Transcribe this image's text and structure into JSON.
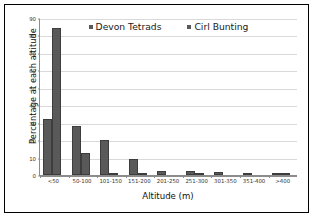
{
  "chart_data": {
    "type": "bar",
    "title": "",
    "xlabel": "Altitude (m)",
    "ylabel": "Percentage at each altitude",
    "categories": [
      "<50",
      "50-100",
      "101-150",
      "151-200",
      "201-250",
      "251-300",
      "301-350",
      "351-400",
      ">400"
    ],
    "series": [
      {
        "name": "Devon Tetrads",
        "color": "#595959",
        "values": [
          32,
          28,
          20,
          9,
          2.3,
          2.3,
          1.8,
          1.3,
          1
        ]
      },
      {
        "name": "Cirl Bunting",
        "color": "#595959",
        "values": [
          84,
          12.5,
          0.7,
          0.6,
          0,
          0.4,
          0,
          0,
          0.3
        ]
      }
    ],
    "ylim": [
      0,
      90
    ],
    "yticks": [
      0,
      10,
      20,
      30,
      40,
      50,
      60,
      70,
      80,
      90
    ],
    "ytick_labels": [
      "0",
      "10",
      "20",
      "30",
      "40",
      "50",
      "60",
      "70",
      "80",
      "90"
    ],
    "grid": "horizontal",
    "legend_position": "top-center-inside",
    "legend": [
      "Devon Tetrads",
      "Cirl Bunting"
    ],
    "bar_color": "#595959",
    "gridline_color": "#d9d9d9",
    "axis_color": "#8c8c8c",
    "frame_color": "#000000"
  }
}
